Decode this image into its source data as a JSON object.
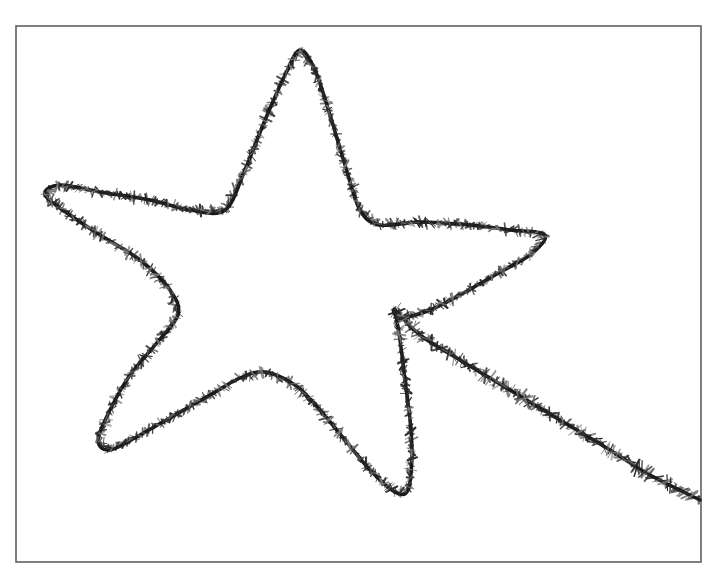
{
  "image": {
    "width": 719,
    "height": 579,
    "background": "#ffffff",
    "description": "Black and white photo of a tinsel pipe-cleaner bent into a five-point star shape with a trailing tail"
  },
  "frame": {
    "x": 16,
    "y": 26,
    "width": 685,
    "height": 536,
    "stroke": "#555555"
  },
  "tinsel": {
    "core_color": "#1a1a1a",
    "bristle_color": "#2a2a2a",
    "bristle_light": "#777777",
    "path": [
      [
        395,
        310
      ],
      [
        400,
        340
      ],
      [
        405,
        380
      ],
      [
        410,
        420
      ],
      [
        412,
        455
      ],
      [
        408,
        490
      ],
      [
        395,
        492
      ],
      [
        370,
        470
      ],
      [
        345,
        440
      ],
      [
        320,
        410
      ],
      [
        295,
        385
      ],
      [
        265,
        372
      ],
      [
        240,
        378
      ],
      [
        210,
        395
      ],
      [
        175,
        415
      ],
      [
        140,
        435
      ],
      [
        110,
        450
      ],
      [
        98,
        440
      ],
      [
        110,
        410
      ],
      [
        130,
        375
      ],
      [
        155,
        345
      ],
      [
        178,
        315
      ],
      [
        170,
        290
      ],
      [
        140,
        260
      ],
      [
        100,
        235
      ],
      [
        70,
        215
      ],
      [
        45,
        195
      ],
      [
        60,
        185
      ],
      [
        100,
        192
      ],
      [
        150,
        200
      ],
      [
        190,
        210
      ],
      [
        225,
        210
      ],
      [
        245,
        170
      ],
      [
        265,
        120
      ],
      [
        285,
        75
      ],
      [
        300,
        50
      ],
      [
        315,
        70
      ],
      [
        330,
        115
      ],
      [
        345,
        165
      ],
      [
        360,
        210
      ],
      [
        380,
        225
      ],
      [
        420,
        222
      ],
      [
        470,
        225
      ],
      [
        510,
        230
      ],
      [
        545,
        235
      ],
      [
        530,
        255
      ],
      [
        495,
        275
      ],
      [
        460,
        295
      ],
      [
        430,
        310
      ],
      [
        400,
        318
      ],
      [
        395,
        310
      ],
      [
        420,
        335
      ],
      [
        460,
        360
      ],
      [
        510,
        390
      ],
      [
        560,
        420
      ],
      [
        610,
        450
      ],
      [
        650,
        475
      ],
      [
        700,
        500
      ]
    ]
  }
}
